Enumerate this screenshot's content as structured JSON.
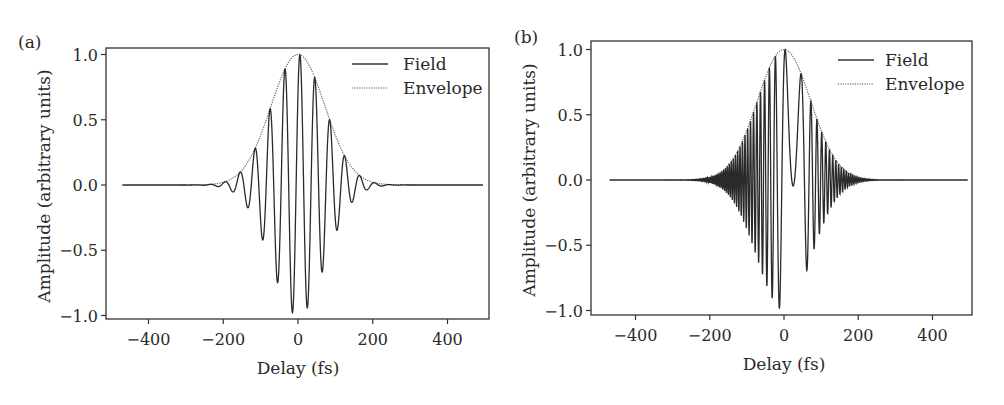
{
  "figure": {
    "panels": [
      {
        "label": "(a)",
        "xlabel": "Delay (fs)",
        "ylabel": "Amplitude (arbitrary units)",
        "legend": {
          "field": "Field",
          "envelope": "Envelope"
        }
      },
      {
        "label": "(b)",
        "xlabel": "Delay (fs)",
        "ylabel": "Amplitude (arbitrary units)",
        "legend": {
          "field": "Field",
          "envelope": "Envelope"
        }
      }
    ]
  },
  "chart_data": [
    {
      "type": "line",
      "panel": "(a)",
      "title": "",
      "xlabel": "Delay (fs)",
      "ylabel": "Amplitude (arbitrary units)",
      "xlim": [
        -500,
        500
      ],
      "ylim": [
        -1.05,
        1.05
      ],
      "xticks": [
        -400,
        -200,
        0,
        200,
        400
      ],
      "xtick_labels": [
        "−400",
        "−200",
        "0",
        "200",
        "400"
      ],
      "yticks": [
        1.0,
        0.5,
        0.0,
        -0.5,
        -1.0
      ],
      "ytick_labels": [
        "1.0",
        "0.5",
        "0.0",
        "−0.5",
        "−1.0"
      ],
      "grid": false,
      "legend_position": "upper right",
      "legend": [
        "Field",
        "Envelope"
      ],
      "model": {
        "envelope_sigma_fs": 72,
        "period_fs": 40,
        "phase_offset_fs": 5,
        "chirp_per_fs2": 0
      },
      "series": [
        {
          "name": "Field",
          "style": "solid",
          "x": [
            -195,
            -175,
            -155,
            -135,
            -115,
            -95,
            -75,
            -55,
            -35,
            -15,
            5,
            25,
            45,
            65,
            85,
            105,
            125,
            145,
            165,
            185
          ],
          "y": [
            -0.02,
            0.05,
            -0.1,
            0.18,
            -0.3,
            0.43,
            -0.6,
            0.75,
            -0.87,
            -0.98,
            1.0,
            -0.9,
            0.8,
            -0.6,
            0.5,
            -0.3,
            0.2,
            -0.1,
            0.06,
            -0.02
          ]
        },
        {
          "name": "Envelope",
          "style": "dotted",
          "x": [
            -300,
            -200,
            -150,
            -100,
            -75,
            -50,
            -25,
            0,
            25,
            50,
            75,
            100,
            150,
            200,
            300
          ],
          "y": [
            0.0,
            0.02,
            0.11,
            0.38,
            0.58,
            0.79,
            0.94,
            1.0,
            0.94,
            0.79,
            0.58,
            0.38,
            0.11,
            0.02,
            0.0
          ]
        }
      ]
    },
    {
      "type": "line",
      "panel": "(b)",
      "title": "",
      "xlabel": "Delay (fs)",
      "ylabel": "Amplitude (arbitrary units)",
      "xlim": [
        -500,
        500
      ],
      "ylim": [
        -1.05,
        1.05
      ],
      "xticks": [
        -400,
        -200,
        0,
        200,
        400
      ],
      "xtick_labels": [
        "−400",
        "−200",
        "0",
        "200",
        "400"
      ],
      "yticks": [
        1.0,
        0.5,
        0.0,
        -0.5,
        -1.0
      ],
      "ytick_labels": [
        "1.0",
        "0.5",
        "0.0",
        "−0.5",
        "−1.0"
      ],
      "grid": false,
      "legend_position": "upper right",
      "legend": [
        "Field",
        "Envelope"
      ],
      "model": {
        "envelope_sigma_fs": 72,
        "period_fs": 42,
        "phase_offset_fs": 3,
        "chirp_per_fs2": -0.00055
      },
      "series": [
        {
          "name": "Field",
          "style": "solid",
          "x": [
            -185,
            -170,
            -155,
            -142,
            -128,
            -113,
            -99,
            -84,
            -69,
            -50,
            -32,
            -16,
            0,
            25,
            51,
            78,
            104,
            133,
            165
          ],
          "y": [
            -0.02,
            -0.06,
            0.1,
            -0.14,
            0.22,
            -0.28,
            0.42,
            -0.5,
            0.67,
            -0.8,
            0.93,
            -1.0,
            1.0,
            -0.9,
            0.77,
            -0.5,
            0.33,
            -0.12,
            0.05
          ]
        },
        {
          "name": "Envelope",
          "style": "dotted",
          "x": [
            -300,
            -200,
            -150,
            -100,
            -75,
            -50,
            -25,
            0,
            25,
            50,
            75,
            100,
            150,
            200,
            300
          ],
          "y": [
            0.0,
            0.02,
            0.11,
            0.38,
            0.58,
            0.79,
            0.94,
            1.0,
            0.94,
            0.79,
            0.58,
            0.38,
            0.11,
            0.02,
            0.0
          ]
        }
      ]
    }
  ]
}
